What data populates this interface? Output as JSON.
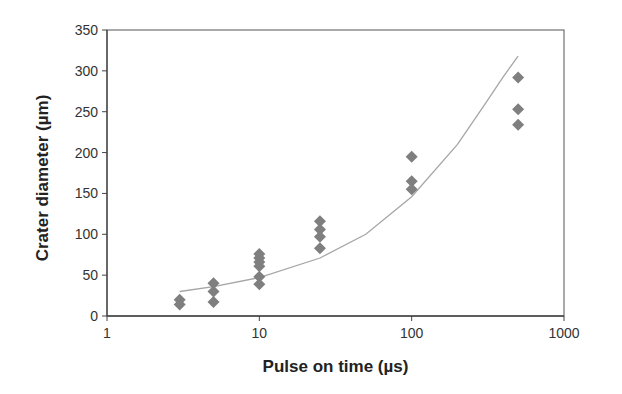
{
  "chart_data": {
    "type": "scatter",
    "title": "",
    "xlabel": "Pulse on time (µs)",
    "ylabel": "Crater diameter (µm)",
    "xscale": "log",
    "xlim": [
      1,
      1000
    ],
    "ylim": [
      0,
      350
    ],
    "xticks": [
      1,
      10,
      100,
      1000
    ],
    "xtick_labels": [
      "1",
      "10",
      "100",
      "1000"
    ],
    "yticks": [
      0,
      50,
      100,
      150,
      200,
      250,
      300,
      350
    ],
    "ytick_labels": [
      "0",
      "50",
      "100",
      "150",
      "200",
      "250",
      "300",
      "350"
    ],
    "grid": false,
    "legend": null,
    "series": [
      {
        "name": "Measured",
        "marker": "diamond",
        "color": "#7f7f7f",
        "points": [
          {
            "x": 3,
            "y": 20
          },
          {
            "x": 3,
            "y": 14
          },
          {
            "x": 5,
            "y": 40
          },
          {
            "x": 5,
            "y": 30
          },
          {
            "x": 5,
            "y": 17
          },
          {
            "x": 10,
            "y": 76
          },
          {
            "x": 10,
            "y": 71
          },
          {
            "x": 10,
            "y": 66
          },
          {
            "x": 10,
            "y": 61
          },
          {
            "x": 10,
            "y": 48
          },
          {
            "x": 10,
            "y": 39
          },
          {
            "x": 25,
            "y": 116
          },
          {
            "x": 25,
            "y": 106
          },
          {
            "x": 25,
            "y": 97
          },
          {
            "x": 25,
            "y": 83
          },
          {
            "x": 100,
            "y": 195
          },
          {
            "x": 100,
            "y": 165
          },
          {
            "x": 100,
            "y": 155
          },
          {
            "x": 500,
            "y": 292
          },
          {
            "x": 500,
            "y": 253
          },
          {
            "x": 500,
            "y": 234
          }
        ]
      },
      {
        "name": "Fit",
        "type": "line",
        "color": "#a6a6a6",
        "x": [
          3,
          5,
          10,
          25,
          50,
          100,
          200,
          300,
          400,
          500
        ],
        "y": [
          30,
          36,
          47,
          71,
          100,
          146,
          210,
          258,
          293,
          318
        ]
      }
    ]
  }
}
